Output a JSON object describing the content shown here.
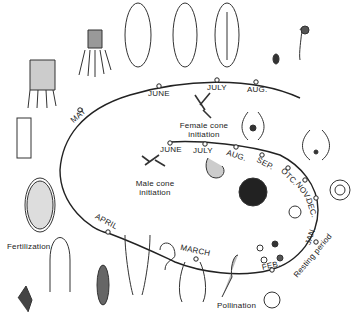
{
  "diagram": {
    "type": "life-cycle",
    "outer_cycle": {
      "months": [
        "MAY",
        "JUNE",
        "JULY",
        "AUG.",
        "APRIL",
        "MARCH"
      ]
    },
    "inner_cycle": {
      "months": [
        "JUNE",
        "JULY",
        "AUG.",
        "SEP.",
        "OTC.",
        "NOV.",
        "DEC.",
        "JAN.",
        "FEB."
      ]
    },
    "labels": {
      "female_cone": "Female cone initiation",
      "female_cone_line1": "Female cone",
      "female_cone_line2": "initiation",
      "male_cone_line1": "Male cone",
      "male_cone_line2": "initiation",
      "fertilization": "Fertilization",
      "pollination": "Pollination",
      "resting_period": "Resting period"
    },
    "colors": {
      "ink": "#222222",
      "background": "#ffffff"
    }
  }
}
